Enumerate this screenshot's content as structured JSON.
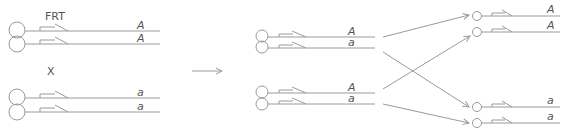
{
  "diagram": {
    "colors": {
      "stroke": "#9a9a9a",
      "text": "#555555"
    },
    "labels": {
      "frt": "FRT",
      "cross": "X"
    },
    "left_parent_top": {
      "allele_1": "A",
      "allele_2": "A"
    },
    "left_parent_bottom": {
      "allele_1": "a",
      "allele_2": "a"
    },
    "middle_top": {
      "allele_1": "A",
      "allele_2": "a"
    },
    "middle_bottom": {
      "allele_1": "A",
      "allele_2": "a"
    },
    "daughter_top": {
      "allele_1": "A",
      "allele_2": "A"
    },
    "daughter_bottom": {
      "allele_1": "a",
      "allele_2": "a"
    }
  }
}
